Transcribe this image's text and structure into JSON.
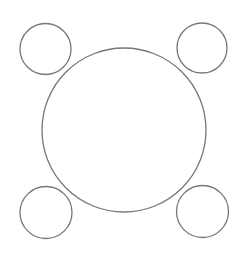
{
  "canvas": {
    "width": 247,
    "height": 259,
    "background": "#ffffff"
  },
  "style": {
    "stroke": "#7a776f",
    "stroke_width": 1.3,
    "fill": "none"
  },
  "shapes": [
    {
      "name": "large-center-circle",
      "cx": 124,
      "cy": 130,
      "r": 82
    },
    {
      "name": "small-circle-top-left",
      "cx": 45.5,
      "cy": 49,
      "r": 25.5
    },
    {
      "name": "small-circle-top-right",
      "cx": 202,
      "cy": 48,
      "r": 25
    },
    {
      "name": "small-circle-bottom-left",
      "cx": 46,
      "cy": 212.5,
      "r": 26
    },
    {
      "name": "small-circle-bottom-right",
      "cx": 202.5,
      "cy": 211.5,
      "r": 26
    }
  ]
}
